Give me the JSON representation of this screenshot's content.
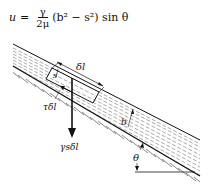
{
  "equation": {
    "lhs": "u",
    "equals": "=",
    "numerator": "γ",
    "denominator": "2μ",
    "rhs": "(b² − s²) sin θ"
  },
  "labels": {
    "delta_l": "δl",
    "s": "s",
    "shear": "τδl",
    "weight": "γsδl",
    "depth": "b",
    "angle": "θ"
  },
  "colors": {
    "ink": "#111111",
    "background": "#ffffff"
  }
}
